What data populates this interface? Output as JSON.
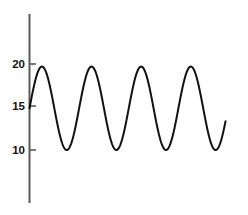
{
  "chart_data": {
    "type": "line",
    "title": "",
    "subtitle": "",
    "xlabel": "",
    "ylabel": "",
    "grid": false,
    "legend": false,
    "legend_position": "none",
    "xlim": [
      0,
      4.1
    ],
    "ylim": [
      7.0,
      23.5
    ],
    "yticks": [
      10,
      15,
      20
    ],
    "ytick_labels": [
      "10",
      "15",
      "20"
    ],
    "xticks": [],
    "xtick_labels": [],
    "axis_style": "y-axis-only",
    "line_color": "#111111",
    "line_width": 2,
    "series": [
      {
        "name": "wave",
        "form": "sinusoid",
        "midline": 14.85,
        "amplitude": 4.85,
        "maximum": 19.7,
        "minimum": 10.0,
        "period": 1.0,
        "cycles": 4.0,
        "phase_start_value": 15.0,
        "x": [
          0.0,
          0.05,
          0.1,
          0.15,
          0.2,
          0.25,
          0.3,
          0.35,
          0.4,
          0.45,
          0.5,
          0.55,
          0.6,
          0.65,
          0.7,
          0.75,
          0.8,
          0.85,
          0.9,
          0.95,
          1.0,
          1.05,
          1.1,
          1.15,
          1.2,
          1.25,
          1.3,
          1.35,
          1.4,
          1.45,
          1.5,
          1.55,
          1.6,
          1.65,
          1.7,
          1.75,
          1.8,
          1.85,
          1.9,
          1.95,
          2.0,
          2.05,
          2.1,
          2.15,
          2.2,
          2.25,
          2.3,
          2.35,
          2.4,
          2.45,
          2.5,
          2.55,
          2.6,
          2.65,
          2.7,
          2.75,
          2.8,
          2.85,
          2.9,
          2.95,
          3.0,
          3.05,
          3.1,
          3.15,
          3.2,
          3.25,
          3.3,
          3.35,
          3.4,
          3.45,
          3.5,
          3.55,
          3.6,
          3.65,
          3.7,
          3.75,
          3.8,
          3.85,
          3.9,
          3.95
        ],
        "y": [
          15.0,
          16.5,
          17.9,
          18.9,
          19.5,
          19.7,
          19.5,
          18.9,
          17.9,
          16.5,
          15.0,
          13.4,
          12.0,
          10.9,
          10.3,
          10.0,
          10.3,
          10.9,
          12.0,
          13.4,
          15.0,
          16.5,
          17.9,
          18.9,
          19.5,
          19.7,
          19.5,
          18.9,
          17.9,
          16.5,
          15.0,
          13.4,
          12.0,
          10.9,
          10.3,
          10.0,
          10.3,
          10.9,
          12.0,
          13.4,
          15.0,
          16.5,
          17.9,
          18.9,
          19.5,
          19.7,
          19.5,
          18.9,
          17.9,
          16.5,
          15.0,
          13.4,
          12.0,
          10.9,
          10.3,
          10.0,
          10.3,
          10.9,
          12.0,
          13.4,
          15.0,
          16.5,
          17.9,
          18.9,
          19.5,
          19.7,
          19.5,
          18.9,
          17.9,
          16.5,
          15.0,
          13.4,
          12.0,
          10.9,
          10.3,
          10.0,
          10.3,
          10.9,
          12.0,
          13.4
        ]
      }
    ],
    "peaks": [
      {
        "x": 0.25,
        "y": 19.7
      },
      {
        "x": 1.25,
        "y": 19.7
      },
      {
        "x": 2.25,
        "y": 19.7
      },
      {
        "x": 3.25,
        "y": 19.7
      }
    ],
    "troughs": [
      {
        "x": 0.75,
        "y": 10.0
      },
      {
        "x": 1.75,
        "y": 10.0
      },
      {
        "x": 2.75,
        "y": 10.0
      },
      {
        "x": 3.75,
        "y": 10.0
      }
    ],
    "start_point": {
      "x": 0.0,
      "y": 15.0
    },
    "end_point": {
      "x": 3.95,
      "y": 13.4
    }
  },
  "axes": {
    "y_axis": {
      "color": "#5a5a5a",
      "top_value": 23.5,
      "bottom_value": 7.0
    },
    "tick_color": "#5a5a5a"
  }
}
